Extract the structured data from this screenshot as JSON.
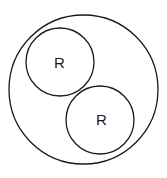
{
  "diagram": {
    "stroke_color": "#1a1a1a",
    "background": "#ffffff",
    "outer_circle": {
      "cx": 83.5,
      "cy": 89.5,
      "r": 74.5
    },
    "inner_circles": [
      {
        "cx": 60,
        "cy": 62,
        "r": 34,
        "label": "R"
      },
      {
        "cx": 100,
        "cy": 120,
        "r": 34,
        "label": "R"
      }
    ]
  }
}
